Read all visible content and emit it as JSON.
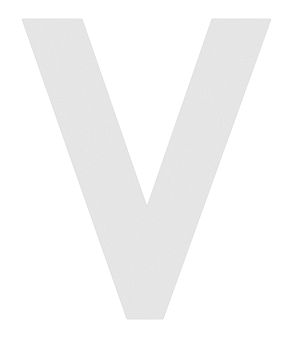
{
  "canvas": {
    "width": 293,
    "height": 337,
    "background_color": "#ffffff"
  },
  "glyph": {
    "character": "V",
    "name": "letter-v",
    "description": "Uppercase letter V",
    "case": "uppercase",
    "fill_color": "#e8e8e8",
    "edge_color": "#e2e2e2",
    "texture": "scanned-paper-grain",
    "outline_points": [
      [
        22,
        19
      ],
      [
        82,
        19
      ],
      [
        147,
        207
      ],
      [
        212,
        19
      ],
      [
        271,
        19
      ],
      [
        163,
        319
      ],
      [
        127,
        319
      ]
    ],
    "metrics": {
      "top_y": 19,
      "bottom_y": 319,
      "left_x": 22,
      "right_x": 271,
      "apex_notch_x": 147,
      "apex_notch_y": 207,
      "bottom_flat_left_x": 127,
      "bottom_flat_right_x": 163
    }
  }
}
